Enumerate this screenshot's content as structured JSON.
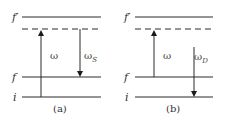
{
  "panels": [
    {
      "caption": "(a)",
      "levels": {
        "f_prime": "f′",
        "f": "f",
        "i": "i"
      },
      "up_arrow": {
        "label": "ω",
        "from": "i",
        "to": "virtual"
      },
      "down_arrow": {
        "label": "ω",
        "subscript": "S",
        "from": "virtual",
        "to": "f"
      }
    },
    {
      "caption": "(b)",
      "levels": {
        "f_prime": "f′",
        "f": "f",
        "i": "i"
      },
      "up_arrow": {
        "label": "ω",
        "from": "f",
        "to": "virtual"
      },
      "down_arrow": {
        "label": "ω",
        "subscript": "D",
        "from": "above-f",
        "to": "i"
      }
    }
  ]
}
